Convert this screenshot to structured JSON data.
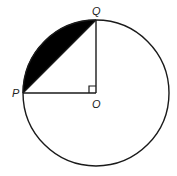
{
  "diagram": {
    "type": "circle-sector-segment",
    "labels": {
      "P": "P",
      "Q": "Q",
      "O": "O"
    },
    "geometry": {
      "center": [
        96,
        93
      ],
      "radius": 73,
      "P": [
        23,
        93
      ],
      "Q": [
        96,
        20
      ],
      "right_angle_at": "O"
    },
    "colors": {
      "stroke": "#1a1a1a",
      "shaded_segment": "#000000",
      "background": "#ffffff"
    }
  }
}
